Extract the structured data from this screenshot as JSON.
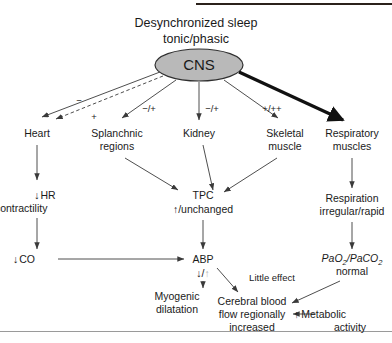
{
  "figure": {
    "title_line1": "Desynchronized sleep",
    "title_line2": "tonic/phasic",
    "center_node": "CNS",
    "colors": {
      "cns_fill": "#b9b9b9",
      "cns_stroke": "#2f2f2f",
      "edge": "#3a3a3a",
      "thick_edge": "#111111",
      "text": "#1a1a1a",
      "faint_arrow": "#b4b4b4",
      "top_rule": "#2b211b",
      "bottom_rule": "#9a9a9a"
    }
  },
  "organs": {
    "heart": "Heart",
    "splanchnic_line1": "Splanchnic",
    "splanchnic_line2": "regions",
    "kidney": "Kidney",
    "skeletal_line1": "Skeletal",
    "skeletal_line2": "muscle",
    "respiratory_line1": "Respiratory",
    "respiratory_line2": "muscles"
  },
  "edge_labels": {
    "heart_inhibit": "−",
    "heart_excite": "+",
    "splanchnic": "−/+",
    "kidney": "−/+",
    "skeletal": "+/++",
    "little_effect": "Little effect"
  },
  "effects": {
    "hr_arrow": "↓",
    "hr_label": "HR",
    "contractility_arrow": "↓",
    "contractility_label": "contractility",
    "co_arrow": "↓",
    "co_label": "CO",
    "tpc_label": "TPC",
    "tpc_arrow": "↑",
    "tpc_state": "/unchanged",
    "abp_label": "ABP",
    "abp_arrow_down": "↓",
    "abp_separator": "/",
    "abp_arrow_up": "↑",
    "myogenic_line1": "Myogenic",
    "myogenic_line2": "dilatation",
    "respiration_line1": "Respiration",
    "respiration_line2": "irregular/rapid",
    "blood_gas_pao2": "PaO",
    "blood_gas_sub2a": "2",
    "blood_gas_slash": "/PaCO",
    "blood_gas_sub2b": "2",
    "blood_gas_state": "normal",
    "cbf_line1": "Cerebral blood",
    "cbf_line2": "flow regionally",
    "cbf_line3": "increased",
    "metabolic_arrow": "↑",
    "metabolic_line1": "Metabolic",
    "metabolic_line2": "activity"
  }
}
